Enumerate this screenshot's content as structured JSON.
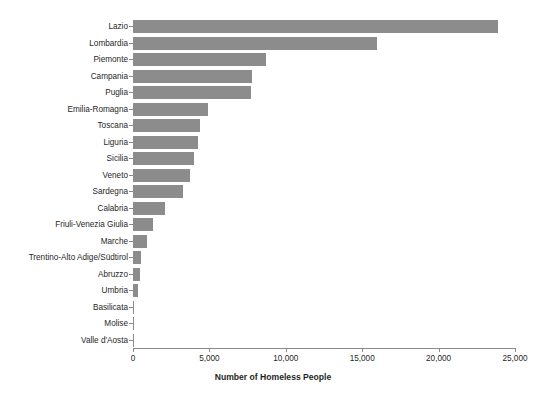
{
  "chart_data": {
    "type": "bar",
    "orientation": "horizontal",
    "title": "",
    "xlabel": "Number of Homeless People",
    "ylabel": "",
    "xlim": [
      0,
      25800
    ],
    "xticks": [
      0,
      5000,
      10000,
      15000,
      20000,
      25000
    ],
    "xtick_labels": [
      "0",
      "5,000",
      "10,000",
      "15,000",
      "20,000",
      "25,000"
    ],
    "grid": false,
    "legend": null,
    "bar_color": "#8c8c8c",
    "axis_color": "#8a8a8a",
    "background": "#ffffff",
    "categories": [
      "Lazio",
      "Lombardia",
      "Piemonte",
      "Campania",
      "Puglia",
      "Emilia-Romagna",
      "Toscana",
      "Liguria",
      "Sicilia",
      "Veneto",
      "Sardegna",
      "Calabria",
      "Friuli-Venezia Giulia",
      "Marche",
      "Trentino-Alto Adige/Südtirol",
      "Abruzzo",
      "Umbria",
      "Basilicata",
      "Molise",
      "Valle d'Aosta"
    ],
    "values": [
      23900,
      16000,
      8700,
      7800,
      7700,
      4900,
      4400,
      4250,
      4000,
      3700,
      3300,
      2100,
      1300,
      900,
      500,
      480,
      300,
      60,
      40,
      20
    ]
  }
}
